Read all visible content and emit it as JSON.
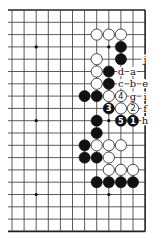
{
  "diagram": {
    "type": "go-board-fragment",
    "columns": 12,
    "rows": 19,
    "edges": {
      "top": true,
      "right": true,
      "bottom": true,
      "left": false
    },
    "grid": {
      "origin_x": 12,
      "origin_y": 10,
      "spacing_x": 12.1,
      "spacing_y": 12.3
    },
    "colors": {
      "black": "#111111",
      "white": "#ffffff",
      "line": "#333333"
    },
    "star_points": [
      {
        "col": 2,
        "row": 3
      },
      {
        "col": 8,
        "row": 3
      },
      {
        "col": 2,
        "row": 9
      },
      {
        "col": 8,
        "row": 9
      },
      {
        "col": 2,
        "row": 15
      },
      {
        "col": 8,
        "row": 15
      }
    ],
    "stones": [
      {
        "col": 7,
        "row": 2,
        "color": "white",
        "label": ""
      },
      {
        "col": 8,
        "row": 2,
        "color": "white",
        "label": ""
      },
      {
        "col": 9,
        "row": 2,
        "color": "white",
        "label": ""
      },
      {
        "col": 9,
        "row": 3,
        "color": "black",
        "label": ""
      },
      {
        "col": 7,
        "row": 4,
        "color": "white",
        "label": ""
      },
      {
        "col": 9,
        "row": 4,
        "color": "black",
        "label": ""
      },
      {
        "col": 7,
        "row": 5,
        "color": "white",
        "label": ""
      },
      {
        "col": 8,
        "row": 5,
        "color": "black",
        "label": ""
      },
      {
        "col": 7,
        "row": 6,
        "color": "white",
        "label": ""
      },
      {
        "col": 8,
        "row": 6,
        "color": "black",
        "label": ""
      },
      {
        "col": 6,
        "row": 7,
        "color": "black",
        "label": ""
      },
      {
        "col": 7,
        "row": 7,
        "color": "black",
        "label": ""
      },
      {
        "col": 8,
        "row": 7,
        "color": "white",
        "label": ""
      },
      {
        "col": 9,
        "row": 7,
        "color": "white",
        "label": "4"
      },
      {
        "col": 8,
        "row": 8,
        "color": "black",
        "label": "3"
      },
      {
        "col": 9,
        "row": 8,
        "color": "white",
        "label": ""
      },
      {
        "col": 10,
        "row": 8,
        "color": "white",
        "label": "2"
      },
      {
        "col": 7,
        "row": 9,
        "color": "black",
        "label": ""
      },
      {
        "col": 9,
        "row": 9,
        "color": "black",
        "label": "5"
      },
      {
        "col": 10,
        "row": 9,
        "color": "black",
        "label": "1"
      },
      {
        "col": 7,
        "row": 10,
        "color": "black",
        "label": ""
      },
      {
        "col": 6,
        "row": 11,
        "color": "black",
        "label": ""
      },
      {
        "col": 7,
        "row": 11,
        "color": "white",
        "label": ""
      },
      {
        "col": 8,
        "row": 11,
        "color": "white",
        "label": ""
      },
      {
        "col": 9,
        "row": 11,
        "color": "white",
        "label": ""
      },
      {
        "col": 6,
        "row": 12,
        "color": "black",
        "label": ""
      },
      {
        "col": 7,
        "row": 12,
        "color": "black",
        "label": ""
      },
      {
        "col": 8,
        "row": 12,
        "color": "white",
        "label": ""
      },
      {
        "col": 8,
        "row": 13,
        "color": "white",
        "label": ""
      },
      {
        "col": 9,
        "row": 13,
        "color": "white",
        "label": ""
      },
      {
        "col": 10,
        "row": 13,
        "color": "white",
        "label": ""
      },
      {
        "col": 7,
        "row": 14,
        "color": "black",
        "label": ""
      },
      {
        "col": 8,
        "row": 14,
        "color": "black",
        "label": ""
      },
      {
        "col": 9,
        "row": 14,
        "color": "black",
        "label": ""
      },
      {
        "col": 10,
        "row": 14,
        "color": "black",
        "label": ""
      }
    ],
    "point_labels": [
      {
        "col": 11,
        "row": 4,
        "text": "j"
      },
      {
        "col": 9,
        "row": 5,
        "text": "d"
      },
      {
        "col": 10,
        "row": 5,
        "text": "a"
      },
      {
        "col": 9,
        "row": 6,
        "text": "c"
      },
      {
        "col": 10,
        "row": 6,
        "text": "b"
      },
      {
        "col": 11,
        "row": 6,
        "text": "e"
      },
      {
        "col": 10,
        "row": 7,
        "text": "g"
      },
      {
        "col": 11,
        "row": 7,
        "text": "i"
      },
      {
        "col": 11,
        "row": 8,
        "text": "f"
      },
      {
        "col": 11,
        "row": 9,
        "text": "h"
      }
    ]
  }
}
